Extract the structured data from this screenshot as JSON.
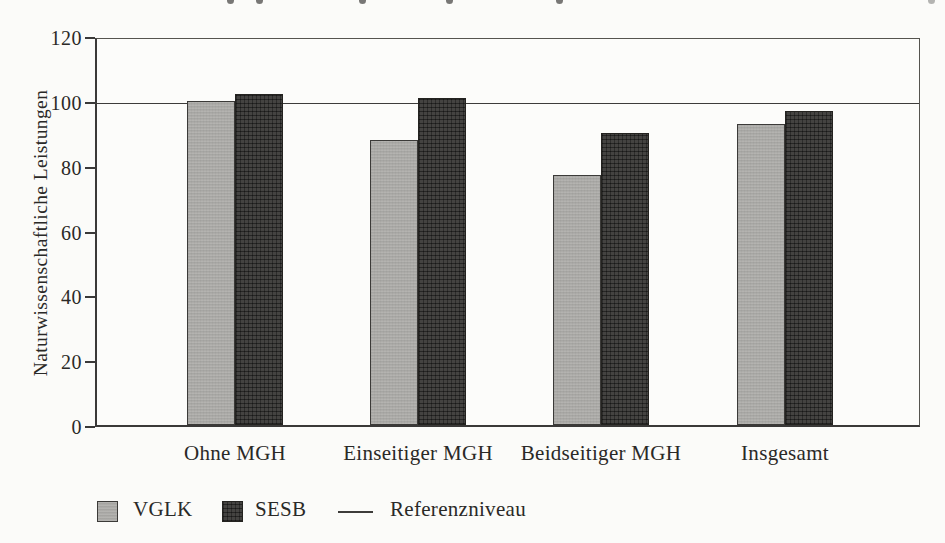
{
  "chart_data": {
    "type": "bar",
    "title": "",
    "categories": [
      "Ohne MGH",
      "Einseitiger MGH",
      "Beidseitiger MGH",
      "Insgesamt"
    ],
    "series": [
      {
        "name": "VGLK",
        "values": [
          100,
          88,
          77,
          93
        ],
        "color": "#aeadaa",
        "pattern": "solid-light-gray"
      },
      {
        "name": "SESB",
        "values": [
          102,
          101,
          90,
          97
        ],
        "color": "#3e3d3b",
        "pattern": "dark-crosshatch"
      }
    ],
    "xlabel": "",
    "ylabel": "Naturwissenschaftliche Leistungen",
    "ylim": [
      0,
      120
    ],
    "yticks": [
      0,
      20,
      40,
      60,
      80,
      100,
      120
    ],
    "reference_line": {
      "value": 100,
      "label": "Referenzniveau"
    },
    "grid": "off",
    "legend_position": "bottom-left",
    "legend": [
      "VGLK",
      "SESB",
      "Referenzniveau"
    ]
  },
  "colors": {
    "background": "#fbfbf9",
    "axis": "#3a3938",
    "text": "#2a2927",
    "bar_light": "#aeadaa",
    "bar_dark": "#3e3d3b"
  }
}
